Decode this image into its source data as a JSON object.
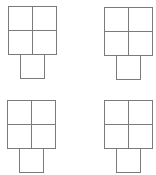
{
  "diagram": {
    "line_color": "#7a7a7a",
    "background": "#ffffff",
    "cell_size": 24,
    "shapes": [
      {
        "name": "top-left",
        "x": 8,
        "y": 6,
        "stem_offset": 12
      },
      {
        "name": "top-right",
        "x": 104,
        "y": 7,
        "stem_offset": 12
      },
      {
        "name": "bottom-left",
        "x": 7,
        "y": 100,
        "stem_offset": 12
      },
      {
        "name": "bottom-right",
        "x": 104,
        "y": 100,
        "stem_offset": 12
      }
    ]
  }
}
